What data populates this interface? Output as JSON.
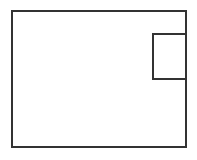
{
  "canvas": {
    "width": 197,
    "height": 160,
    "background_color": "#ffffff"
  },
  "diagram": {
    "stroke_color": "#333333",
    "fill_color": "#ffffff",
    "stroke_width": 2,
    "shapes": [
      {
        "name": "outer-rectangle",
        "type": "rect",
        "x": 12,
        "y": 11,
        "width": 174,
        "height": 136,
        "stroke_color": "#333333",
        "fill_color": "#ffffff",
        "stroke_width": 2
      },
      {
        "name": "inner-rectangle",
        "type": "rect",
        "x": 153,
        "y": 34,
        "width": 33,
        "height": 45,
        "stroke_color": "#333333",
        "fill_color": "#ffffff",
        "stroke_width": 2
      }
    ]
  }
}
